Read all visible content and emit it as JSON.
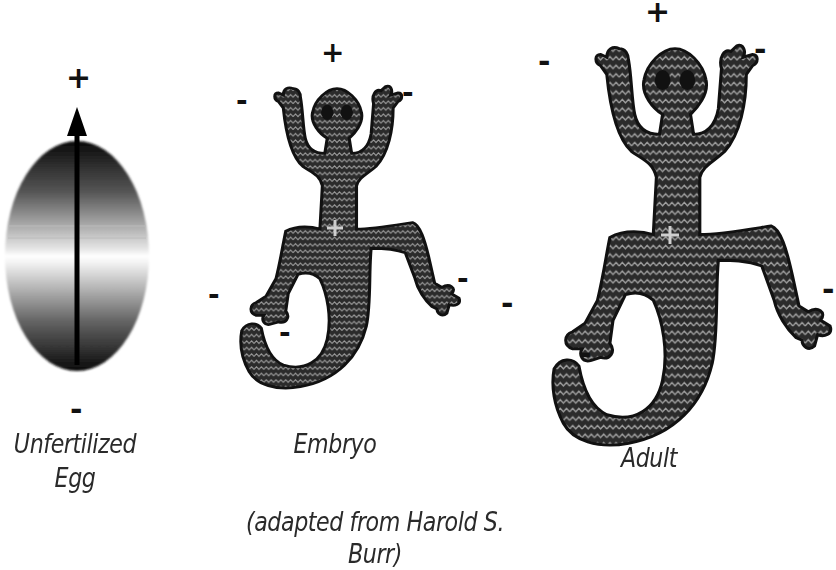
{
  "diagram": {
    "stages": [
      {
        "id": "egg",
        "label_line1": "Unfertilized",
        "label_line2": "Egg",
        "top_sign": "+",
        "bottom_sign": "-"
      },
      {
        "id": "embryo",
        "label": "Embryo",
        "center_sign": "+",
        "outer_signs": [
          "+",
          "-",
          "-",
          "-",
          "-",
          "-"
        ]
      },
      {
        "id": "adult",
        "label": "Adult",
        "center_sign": "+",
        "outer_signs": [
          "+",
          "-",
          "-",
          "-",
          "-",
          "-"
        ]
      }
    ],
    "caption": "(adapted from Harold S. Burr)",
    "colors": {
      "body_fill": "#2b2b2b",
      "pattern_line": "#9a9a9a",
      "center_plus": "#c8c8c8",
      "text": "#2a2a2a"
    }
  }
}
